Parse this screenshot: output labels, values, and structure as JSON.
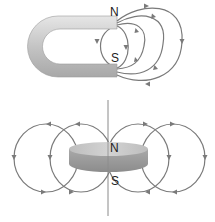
{
  "figure": {
    "top": {
      "name": "horseshoe magnet",
      "north_label": "N",
      "south_label": "S"
    },
    "bottom": {
      "name": "disc magnet",
      "north_label": "N",
      "south_label": "S"
    }
  },
  "colors": {
    "field_line": "#7a7a7a",
    "magnet_light": "#d9d9d9",
    "magnet_dark": "#9a9a9a",
    "axis_line": "#8a8a8a"
  }
}
